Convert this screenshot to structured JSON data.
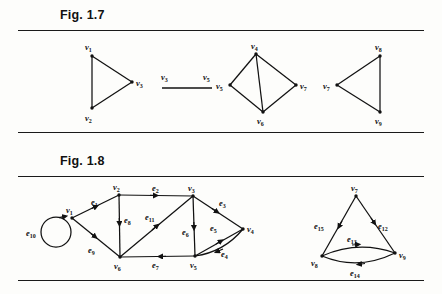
{
  "page": {
    "background_color": "#fdfdfb",
    "ink_color": "#111111",
    "rules": [
      30,
      132,
      176,
      280
    ]
  },
  "figures": [
    {
      "id": "fig-1-7",
      "label": "Fig. 1.7",
      "caption_position": {
        "x": 60,
        "y": 8
      },
      "type": "undirected-graphs",
      "graphs": [
        {
          "name": "triangle-v1-v2-v3",
          "vertices": [
            {
              "id": "v1",
              "label": "v",
              "sub": "1",
              "x": 92,
              "y": 56,
              "label_pos": "above-left"
            },
            {
              "id": "v2",
              "label": "v",
              "sub": "2",
              "x": 92,
              "y": 108,
              "label_pos": "below-left"
            },
            {
              "id": "v3",
              "label": "v",
              "sub": "3",
              "x": 132,
              "y": 82,
              "label_pos": "right"
            }
          ],
          "edges": [
            [
              "v1",
              "v2"
            ],
            [
              "v1",
              "v3"
            ],
            [
              "v2",
              "v3"
            ]
          ]
        },
        {
          "name": "single-edge-v3-v5",
          "vertices": [
            {
              "id": "v3b",
              "label": "v",
              "sub": "3",
              "x": 164,
              "y": 84,
              "label_pos": "above"
            },
            {
              "id": "v5b",
              "label": "v",
              "sub": "5",
              "x": 208,
              "y": 84,
              "label_pos": "above"
            }
          ],
          "edges": [
            [
              "v3b",
              "v5b"
            ]
          ]
        },
        {
          "name": "quad-v4-v5-v6-v7",
          "vertices": [
            {
              "id": "v4",
              "label": "v",
              "sub": "4",
              "x": 256,
              "y": 54,
              "label_pos": "above"
            },
            {
              "id": "v5",
              "label": "v",
              "sub": "5",
              "x": 230,
              "y": 85,
              "label_pos": "left"
            },
            {
              "id": "v6",
              "label": "v",
              "sub": "6",
              "x": 263,
              "y": 112,
              "label_pos": "below"
            },
            {
              "id": "v7",
              "label": "v",
              "sub": "7",
              "x": 296,
              "y": 85,
              "label_pos": "right"
            }
          ],
          "edges": [
            [
              "v4",
              "v5"
            ],
            [
              "v4",
              "v7"
            ],
            [
              "v5",
              "v6"
            ],
            [
              "v6",
              "v7"
            ],
            [
              "v4",
              "v6"
            ]
          ]
        },
        {
          "name": "triangle-v7-v8-v9",
          "vertices": [
            {
              "id": "v7c",
              "label": "v",
              "sub": "7",
              "x": 337,
              "y": 85,
              "label_pos": "left"
            },
            {
              "id": "v8c",
              "label": "v",
              "sub": "8",
              "x": 380,
              "y": 56,
              "label_pos": "above"
            },
            {
              "id": "v9c",
              "label": "v",
              "sub": "9",
              "x": 380,
              "y": 112,
              "label_pos": "below"
            }
          ],
          "edges": [
            [
              "v7c",
              "v8c"
            ],
            [
              "v7c",
              "v9c"
            ],
            [
              "v8c",
              "v9c"
            ]
          ]
        }
      ]
    },
    {
      "id": "fig-1-8",
      "label": "Fig. 1.8",
      "caption_position": {
        "x": 60,
        "y": 154
      },
      "type": "directed-multigraphs",
      "graphs": [
        {
          "name": "digraph-left",
          "vertices": [
            {
              "id": "v1",
              "label": "v",
              "sub": "1",
              "x": 72,
              "y": 218,
              "label_pos": "above"
            },
            {
              "id": "v2",
              "label": "v",
              "sub": "2",
              "x": 119,
              "y": 195,
              "label_pos": "above"
            },
            {
              "id": "v3",
              "label": "v",
              "sub": "3",
              "x": 193,
              "y": 196,
              "label_pos": "above"
            },
            {
              "id": "v4",
              "label": "v",
              "sub": "4",
              "x": 243,
              "y": 229,
              "label_pos": "right"
            },
            {
              "id": "v5",
              "label": "v",
              "sub": "5",
              "x": 195,
              "y": 256,
              "label_pos": "below"
            },
            {
              "id": "v6",
              "label": "v",
              "sub": "6",
              "x": 120,
              "y": 257,
              "label_pos": "below"
            }
          ],
          "edges": [
            {
              "id": "e1",
              "label": "e",
              "sub": "1",
              "from": "v1",
              "to": "v2",
              "label_x": 95,
              "label_y": 203
            },
            {
              "id": "e2",
              "label": "e",
              "sub": "2",
              "from": "v2",
              "to": "v3",
              "label_x": 156,
              "label_y": 192
            },
            {
              "id": "e3",
              "label": "e",
              "sub": "3",
              "from": "v3",
              "to": "v4",
              "label_x": 222,
              "label_y": 206
            },
            {
              "id": "e4",
              "label": "e",
              "sub": "4",
              "from": "v4",
              "to": "v5",
              "label_x": 224,
              "label_y": 254
            },
            {
              "id": "e5",
              "label": "e",
              "sub": "5",
              "from": "v5",
              "to": "v4",
              "label_x": 213,
              "label_y": 228
            },
            {
              "id": "e6",
              "label": "e",
              "sub": "6",
              "from": "v3",
              "to": "v5",
              "label_x": 186,
              "label_y": 232
            },
            {
              "id": "e7",
              "label": "e",
              "sub": "7",
              "from": "v5",
              "to": "v6",
              "label_x": 156,
              "label_y": 260
            },
            {
              "id": "e8",
              "label": "e",
              "sub": "8",
              "from": "v2",
              "to": "v6",
              "label_x": 127,
              "label_y": 225
            },
            {
              "id": "e9",
              "label": "e",
              "sub": "9",
              "from": "v1",
              "to": "v6",
              "label_x": 93,
              "label_y": 250
            },
            {
              "id": "e10",
              "label": "e",
              "sub": "10",
              "from": "v1",
              "to": "v1",
              "label_x": 36,
              "label_y": 233,
              "kind": "self-loop"
            },
            {
              "id": "e11",
              "label": "e",
              "sub": "11",
              "from": "v6",
              "to": "v3",
              "label_x": 150,
              "label_y": 218
            }
          ]
        },
        {
          "name": "digraph-right",
          "vertices": [
            {
              "id": "v7",
              "label": "v",
              "sub": "7",
              "x": 356,
              "y": 196,
              "label_pos": "above"
            },
            {
              "id": "v8",
              "label": "v",
              "sub": "8",
              "x": 322,
              "y": 256,
              "label_pos": "below-left"
            },
            {
              "id": "v9",
              "label": "v",
              "sub": "9",
              "x": 395,
              "y": 253,
              "label_pos": "right"
            }
          ],
          "edges": [
            {
              "id": "e15",
              "label": "e",
              "sub": "15",
              "from": "v7",
              "to": "v8",
              "label_x": 321,
              "label_y": 226
            },
            {
              "id": "e12",
              "label": "e",
              "sub": "12",
              "from": "v7",
              "to": "v9",
              "label_x": 382,
              "label_y": 226
            },
            {
              "id": "e13",
              "label": "e",
              "sub": "13",
              "from": "v8",
              "to": "v9",
              "label_x": 352,
              "label_y": 240,
              "kind": "curve-up"
            },
            {
              "id": "e14",
              "label": "e",
              "sub": "14",
              "from": "v9",
              "to": "v8",
              "label_x": 355,
              "label_y": 271,
              "kind": "curve-down"
            }
          ]
        }
      ]
    }
  ]
}
